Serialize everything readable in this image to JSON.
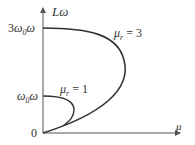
{
  "diagram": {
    "y_axis_label": "Lω",
    "x_axis_label": "μ",
    "origin_label": "0",
    "ticks": {
      "top": {
        "coef": "3",
        "text": "ω",
        "sub": "0",
        "tail": "ω"
      },
      "low": {
        "text": "ω",
        "sub": "0",
        "tail": "ω"
      }
    },
    "curves": [
      {
        "name": "μr = 3",
        "label_main": "μ",
        "label_sub": "r",
        "label_eq": " = 3"
      },
      {
        "name": "μr = 1",
        "label_main": "μ",
        "label_sub": "r",
        "label_eq": " = 1"
      }
    ],
    "colors": {
      "line": "#333333",
      "axis": "#555555"
    }
  }
}
